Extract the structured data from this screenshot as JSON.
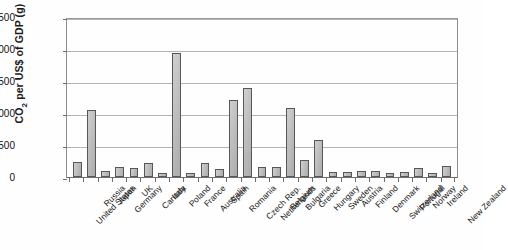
{
  "chart_data": {
    "type": "bar",
    "title": "",
    "xlabel": "",
    "ylabel": "CO2 per US$ of GDP (g)",
    "ylabel_parts": {
      "pre": "CO",
      "sub": "2",
      "post": " per US$ of GDP (g)"
    },
    "ylim": [
      0,
      2500
    ],
    "yticks": [
      2500,
      2000,
      1500,
      1000,
      500,
      0
    ],
    "grid": true,
    "legend": "none",
    "bar_fill": "#bfbfbf",
    "bar_border": "#575757",
    "categories": [
      "United States",
      "Russia",
      "Japan",
      "Germany",
      "UK",
      "Canada",
      "Italy",
      "Poland",
      "France",
      "Australia",
      "Spain",
      "Romania",
      "Czech Rep.",
      "Netherlands",
      "Belgium",
      "Bulgaria",
      "Greece",
      "Hungary",
      "Sweden",
      "Austria",
      "Finland",
      "Denmark",
      "Switzerland",
      "Portugal",
      "Norway",
      "Ireland",
      "New Zealand"
    ],
    "values": [
      240,
      1050,
      100,
      160,
      145,
      215,
      70,
      1930,
      65,
      215,
      125,
      1210,
      1390,
      155,
      150,
      1080,
      270,
      580,
      80,
      85,
      95,
      100,
      60,
      80,
      140,
      65,
      165
    ]
  }
}
